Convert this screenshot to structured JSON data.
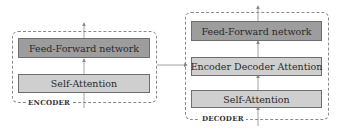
{
  "encoder": {
    "label": "ENCODER",
    "blocks": [
      {
        "label": "Feed-Forward network",
        "shade": "dark"
      },
      {
        "label": "Self-Attention",
        "shade": "light"
      }
    ]
  },
  "decoder": {
    "label": "DECODER",
    "blocks": [
      {
        "label": "Feed-Forward network",
        "shade": "dark"
      },
      {
        "label": "Encoder Decoder Attention",
        "shade": "light"
      },
      {
        "label": "Self-Attention",
        "shade": "light"
      }
    ]
  },
  "colors": {
    "dark_block": "#9d9d9d",
    "light_block": "#cfcfcf",
    "border": "#6e6e6e",
    "arrow": "#8a8a8a"
  }
}
